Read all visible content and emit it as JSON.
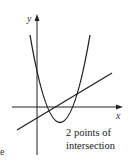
{
  "diagram": {
    "axes": {
      "x_label": "x",
      "y_label": "y"
    },
    "curves": [
      {
        "type": "parabola",
        "description": "upward-opening parabola crossing x-axis twice"
      },
      {
        "type": "line",
        "description": "straight line with positive slope"
      }
    ],
    "caption": {
      "line1": "2 points of",
      "line2": "intersection"
    },
    "edge_text": "e",
    "colors": {
      "stroke": "#222222",
      "background": "#ffffff"
    }
  }
}
